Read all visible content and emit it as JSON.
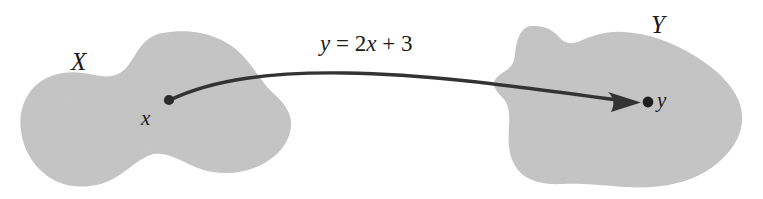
{
  "figure": {
    "type": "mapping-diagram",
    "background_color": "#ffffff",
    "blob_fill_color": "#c6c6c6",
    "ink_color": "#333333"
  },
  "domain_set": {
    "label": "X",
    "point_label": "x"
  },
  "codomain_set": {
    "label": "Y",
    "point_label": "y"
  },
  "mapping": {
    "equation_variable": "y",
    "equation_equals": "=",
    "equation_coefficient": "2",
    "equation_input": "x",
    "equation_plus": "+",
    "equation_constant": "3",
    "equation_full": "y = 2x + 3",
    "arrow_direction": "left-to-right"
  }
}
